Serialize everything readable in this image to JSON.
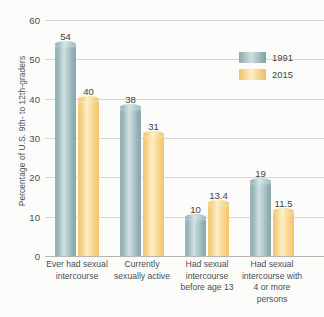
{
  "chart_data": {
    "type": "bar",
    "title": "",
    "subtitle": "",
    "xlabel": "",
    "ylabel": "Percentage of U.S. 9th- to 12th-graders",
    "ylim": [
      0,
      60
    ],
    "ytick_values": [
      60,
      50,
      40,
      30,
      20,
      10,
      0
    ],
    "ytick_labels": [
      "60",
      "50",
      "40",
      "30",
      "20",
      "10",
      "0"
    ],
    "grid": true,
    "grid_axis": "y",
    "legend_position": "top-right",
    "categories": [
      "Ever had sexual intercourse",
      "Currently sexually active",
      "Had sexual intercourse before age 13",
      "Had sexual intercourse with 4 or more persons"
    ],
    "series": [
      {
        "name": "1991",
        "color": "#8fb0b5",
        "values": [
          54,
          38,
          10,
          19
        ],
        "labels": [
          "54",
          "38",
          "10",
          "19"
        ]
      },
      {
        "name": "2015",
        "color": "#f5cf7d",
        "values": [
          40,
          31,
          13.4,
          11.5
        ],
        "labels": [
          "40",
          "31",
          "13.4",
          "11.5"
        ]
      }
    ]
  },
  "axis": {
    "y_title": "Percentage of U.S. 9th- to 12th-graders"
  },
  "legend": {
    "items": [
      {
        "label": "1991"
      },
      {
        "label": "2015"
      }
    ]
  },
  "colors": {
    "series_1991": "#8fb0b5",
    "series_2015": "#f5cf7d",
    "gridline": "#d9d7d2",
    "axis": "#b9b6b0",
    "background": "#fcfcfa",
    "text": "#4b4f52"
  }
}
